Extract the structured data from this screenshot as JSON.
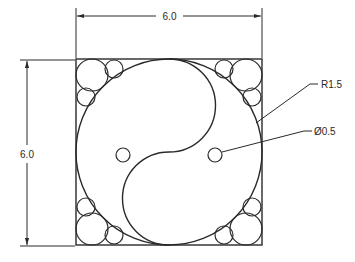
{
  "drawing": {
    "title": "Yin-yang inscribed in square with packed corner circles",
    "stroke_color": "#2a2a2a",
    "background": "#ffffff"
  },
  "dimensions": {
    "width_label": "6.0",
    "height_label": "6.0",
    "radius_label": "R1.5",
    "diameter_label": "Ø0.5"
  },
  "geometry": {
    "square_size": 6.0,
    "big_circle_radius": 3.0,
    "s_curve_radius": 1.5,
    "eye_diameter": 0.5
  }
}
